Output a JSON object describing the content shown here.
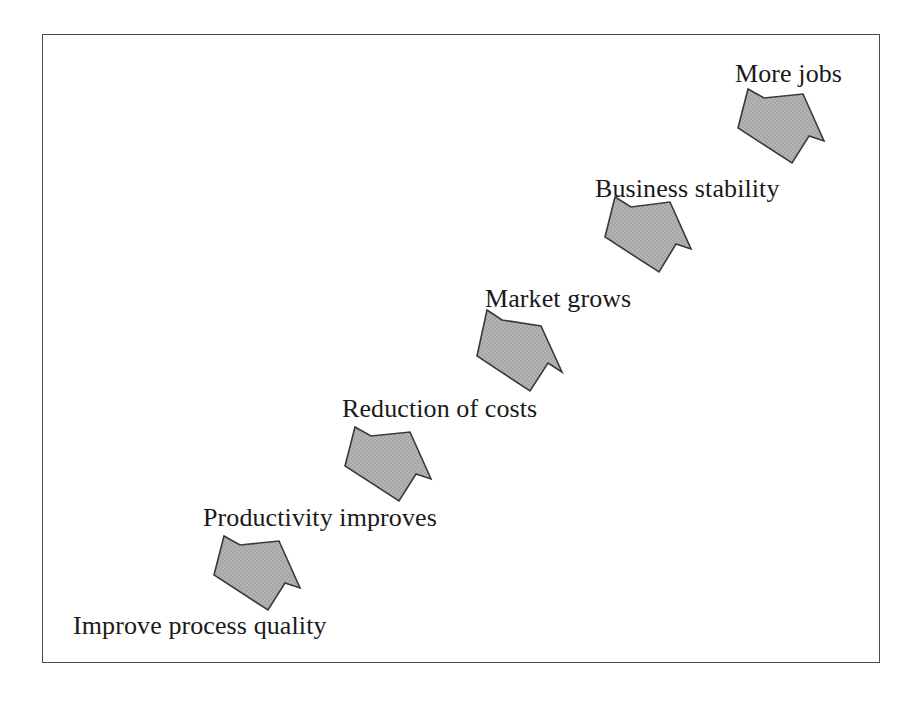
{
  "diagram": {
    "type": "flow-sequence",
    "direction": "ascending-left-to-right",
    "background_color": "#ffffff",
    "frame": {
      "name": "outer-border",
      "x": 42,
      "y": 34,
      "width": 838,
      "height": 629,
      "stroke_color": "#4a4a4a",
      "stroke_width": 1.6
    },
    "arrow_style": {
      "fill_color": "#b0b0b0",
      "stroke_color": "#3a3a3a",
      "stroke_width": 1.6,
      "shape": "block-arrow-notched-tail",
      "rotation_degrees": 45,
      "texture": "halftone-screen"
    },
    "steps": [
      {
        "index": 1,
        "label": "Improve process quality",
        "label_x": 73,
        "label_y": 635,
        "arrow": {
          "name": "arrow-improve-process-quality",
          "points": "224,536 240,545 279,541 300,588 285,583 268,610 214,575"
        }
      },
      {
        "index": 2,
        "label": "Productivity improves",
        "label_x": 203,
        "label_y": 527,
        "arrow": {
          "name": "arrow-productivity-improves",
          "points": "355,427 371,436 410,432 431,479 416,474 399,501 345,466"
        }
      },
      {
        "index": 3,
        "label": "Reduction of costs",
        "label_x": 342,
        "label_y": 418,
        "arrow": {
          "name": "arrow-reduction-of-costs",
          "points": "487,310 502,320 541,326 562,372 548,363 530,391 477,356"
        }
      },
      {
        "index": 4,
        "label": "Market grows",
        "label_x": 485,
        "label_y": 308,
        "arrow": {
          "name": "arrow-market-grows",
          "points": "615,197 631,207 670,202 691,249 676,244 659,272 605,237"
        }
      },
      {
        "index": 5,
        "label": "Business stability",
        "label_x": 595,
        "label_y": 198,
        "arrow": {
          "name": "arrow-business-stability",
          "points": "748,89 764,98 803,94 824,141 809,136 792,163 738,128"
        }
      },
      {
        "index": 6,
        "label": "More jobs",
        "label_x": 735,
        "label_y": 83,
        "arrow": null
      }
    ]
  }
}
